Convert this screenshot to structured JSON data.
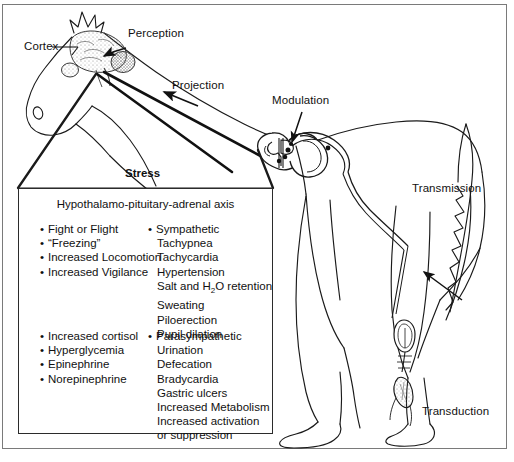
{
  "figure": {
    "type": "anatomical-line-diagram",
    "topic": "Pain and stress response pathway"
  },
  "labels": {
    "cortex": "Cortex",
    "perception": "Perception",
    "projection": "Projection",
    "modulation": "Modulation",
    "transmission": "Transmission",
    "transduction": "Transduction"
  },
  "stress_box": {
    "title": "Stress",
    "subtitle": "Hypothalamo-pituitary-adrenal axis",
    "columns": [
      {
        "id": "behavioral",
        "items": [
          {
            "bullet": true,
            "text": "Fight or Flight"
          },
          {
            "bullet": true,
            "text": "“Freezing”"
          },
          {
            "bullet": true,
            "text": "Increased Locomotion"
          },
          {
            "bullet": true,
            "text": "Increased Vigilance"
          }
        ]
      },
      {
        "id": "sympathetic",
        "items": [
          {
            "bullet": true,
            "text": "Sympathetic"
          },
          {
            "bullet": false,
            "text": "Tachypnea"
          },
          {
            "bullet": false,
            "text": "Tachycardia"
          },
          {
            "bullet": false,
            "text": "Hypertension"
          },
          {
            "bullet": false,
            "text": "Salt and H2O retention",
            "html": "Salt and H<sub>2</sub>O retention"
          },
          {
            "bullet": false,
            "text": "Sweating"
          },
          {
            "bullet": false,
            "text": "Piloerection"
          },
          {
            "bullet": false,
            "text": "Pupil dilation"
          }
        ]
      },
      {
        "id": "endocrine",
        "items": [
          {
            "bullet": true,
            "text": "Increased cortisol"
          },
          {
            "bullet": true,
            "text": "Hyperglycemia"
          },
          {
            "bullet": true,
            "text": "Epinephrine"
          },
          {
            "bullet": true,
            "text": "Norepinephrine"
          }
        ]
      },
      {
        "id": "parasympathetic",
        "items": [
          {
            "bullet": true,
            "text": "Parasympathetic"
          },
          {
            "bullet": false,
            "text": "Urination"
          },
          {
            "bullet": false,
            "text": "Defecation"
          },
          {
            "bullet": false,
            "text": "Bradycardia"
          },
          {
            "bullet": false,
            "text": "Gastric ulcers"
          },
          {
            "bullet": false,
            "text": "Increased Metabolism"
          },
          {
            "bullet": false,
            "text": "Increased activation"
          },
          {
            "bullet": false,
            "text": "   or suppression",
            "indent": true
          }
        ]
      }
    ]
  },
  "colors": {
    "ink": "#111111",
    "line": "#1a1a1a",
    "frame": "#7a7a7a",
    "background": "#ffffff"
  }
}
